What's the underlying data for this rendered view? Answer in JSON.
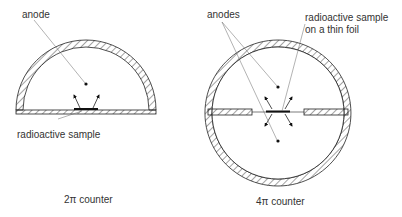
{
  "diagram": {
    "left": {
      "caption": "2π counter",
      "anode_label": "anode",
      "sample_label": "radioactive sample"
    },
    "right": {
      "caption": "4π counter",
      "anodes_label": "anodes",
      "sample_label_line1": "radioactive sample",
      "sample_label_line2": "on a thin foil"
    },
    "colors": {
      "stroke": "#222222",
      "text": "#333333",
      "background": "#ffffff"
    }
  }
}
